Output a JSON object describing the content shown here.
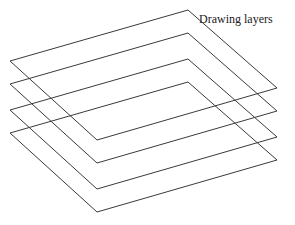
{
  "diagram": {
    "title": "Drawing layers",
    "layer_count": 4,
    "layers": [
      {
        "name": "layer-1"
      },
      {
        "name": "layer-2"
      },
      {
        "name": "layer-3"
      },
      {
        "name": "layer-4"
      }
    ],
    "stroke_color": "#3a3a3a"
  }
}
